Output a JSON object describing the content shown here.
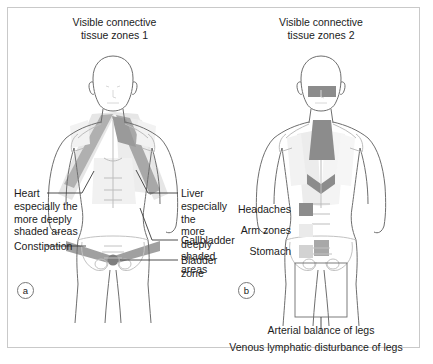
{
  "figure": {
    "border_color": "#c9c9c9",
    "background": "#ffffff"
  },
  "panel_a": {
    "letter": "a",
    "title_line1": "Visible connective",
    "title_line2": "tissue zones 1",
    "labels": {
      "heart": "Heart",
      "heart_detail": "especially the\nmore deeply\nshaded areas",
      "constipation": "Constipation",
      "liver": "Liver",
      "liver_detail": "especially the\nmore deeply\nshaded areas",
      "gallbladder": "Gallbladder",
      "bladder_zone": "Bladder zone"
    }
  },
  "panel_b": {
    "letter": "b",
    "title_line1": "Visible connective",
    "title_line2": "tissue zones 2",
    "legend": [
      {
        "label": "Headaches",
        "color": "#8c8c8c"
      },
      {
        "label": "Arm zones",
        "color": "#eaeaea"
      },
      {
        "label": "Stomach",
        "color": "#d2d2d2"
      }
    ],
    "captions": {
      "arterial": "Arterial balance of legs",
      "venous": "Venous lymphatic disturbance of legs"
    }
  },
  "palette": {
    "outline": "#6e6e6e",
    "outline_soft": "#bdbdbd",
    "zone_dark": "#8c8c8c",
    "zone_mid": "#b4b4b4",
    "zone_light": "#d2d2d2",
    "zone_faint": "#eaeaea",
    "leader": "#3a3a3a"
  }
}
